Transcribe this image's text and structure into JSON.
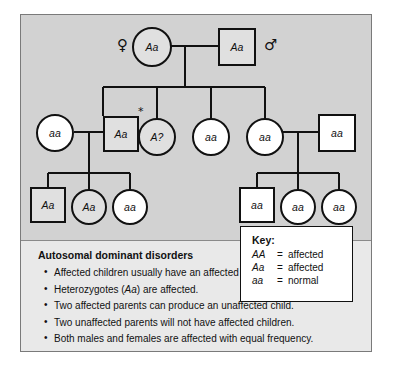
{
  "figure": {
    "background_color": "#d2d2d2",
    "panel_color": "#e9e9e9",
    "affected_fill": "#e0e0e0",
    "unaffected_fill": "#ffffff",
    "stroke_color": "#111111"
  },
  "pedigree": {
    "female_symbol": "♀",
    "male_symbol": "♂",
    "proband_marker": "*",
    "generation1": [
      {
        "shape": "circle",
        "genotype": "Aa",
        "status": "affected"
      },
      {
        "shape": "square",
        "genotype": "Aa",
        "status": "affected"
      }
    ],
    "generation2": [
      {
        "shape": "circle",
        "genotype": "aa",
        "status": "normal"
      },
      {
        "shape": "square",
        "genotype": "Aa",
        "status": "affected",
        "marked": true
      },
      {
        "shape": "circle",
        "genotype": "A?",
        "status": "affected"
      },
      {
        "shape": "circle",
        "genotype": "aa",
        "status": "normal"
      },
      {
        "shape": "circle",
        "genotype": "aa",
        "status": "normal"
      },
      {
        "shape": "square",
        "genotype": "aa",
        "status": "normal"
      }
    ],
    "generation3_left": [
      {
        "shape": "square",
        "genotype": "Aa",
        "status": "affected"
      },
      {
        "shape": "circle",
        "genotype": "Aa",
        "status": "affected"
      },
      {
        "shape": "circle",
        "genotype": "aa",
        "status": "normal"
      }
    ],
    "generation3_right": [
      {
        "shape": "square",
        "genotype": "aa",
        "status": "normal"
      },
      {
        "shape": "circle",
        "genotype": "aa",
        "status": "normal"
      },
      {
        "shape": "circle",
        "genotype": "aa",
        "status": "normal"
      }
    ]
  },
  "key": {
    "title": "Key:",
    "rows": [
      {
        "genotype": "AA",
        "eq": "=",
        "meaning": "affected"
      },
      {
        "genotype": "Aa",
        "eq": "=",
        "meaning": "affected"
      },
      {
        "genotype": "aa",
        "eq": "=",
        "meaning": "normal"
      }
    ]
  },
  "notes": {
    "title": "Autosomal dominant disorders",
    "bullets": [
      "Affected children usually have an affected parent.",
      "Heterozygotes (Aa) are affected.",
      "Two affected parents can produce an unaffected child.",
      "Two unaffected parents will not have affected children.",
      "Both males and females are affected with equal frequency."
    ]
  }
}
